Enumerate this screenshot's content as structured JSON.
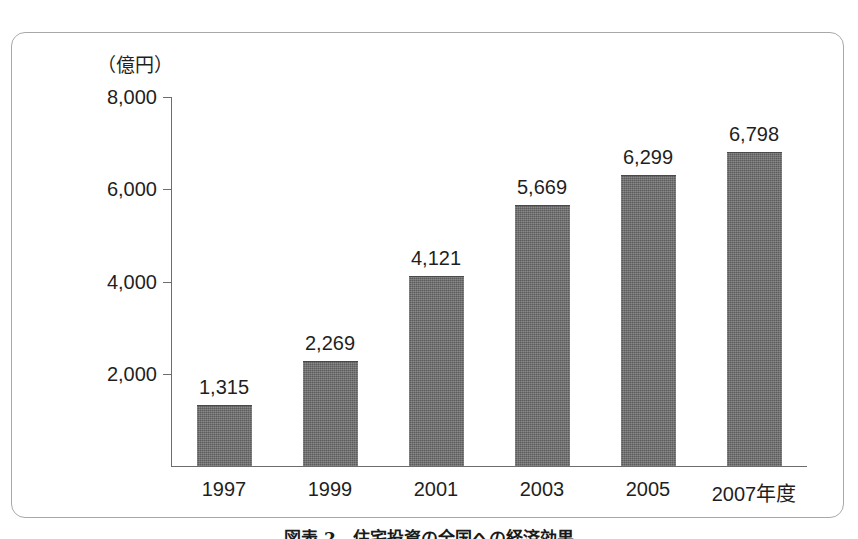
{
  "figure": {
    "unit_label": "（億円）",
    "caption": "図表 2　住宅投資の全国への経済効果"
  },
  "chart_data": {
    "type": "bar",
    "title": "",
    "xlabel": "",
    "ylabel": "（億円）",
    "categories": [
      "1997",
      "1999",
      "2001",
      "2003",
      "2005",
      "2007年度"
    ],
    "values": [
      1315,
      2269,
      4121,
      5669,
      6299,
      6798
    ],
    "value_labels": [
      "1,315",
      "2,269",
      "4,121",
      "5,669",
      "6,299",
      "6,798"
    ],
    "ylim": [
      0,
      8000
    ],
    "yticks": [
      2000,
      4000,
      6000,
      8000
    ],
    "ytick_labels": [
      "2,000",
      "4,000",
      "6,000",
      "8,000"
    ],
    "grid": false,
    "legend": "none",
    "bar_color": "#5c5c5c"
  }
}
